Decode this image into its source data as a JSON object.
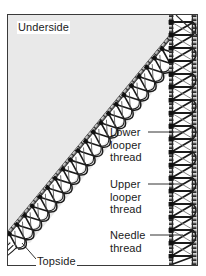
{
  "figure": {
    "border_color": "#3a3a3a",
    "fabric_fill": "#e9e9e9",
    "background": "#ffffff",
    "thread_color": "#1b1b1b"
  },
  "labels": {
    "underside": "Underside",
    "topside": "Topside",
    "lower_looper": {
      "line1": "Lower",
      "line2": "looper",
      "line3": "thread"
    },
    "upper_looper": {
      "line1": "Upper",
      "line2": "looper",
      "line3": "thread"
    },
    "needle": {
      "line1": "Needle",
      "line2": "thread"
    }
  }
}
